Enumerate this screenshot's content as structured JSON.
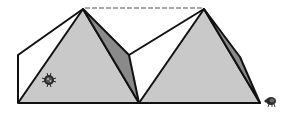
{
  "diagram": {
    "colors": {
      "background": "#ffffff",
      "outline": "#111111",
      "front_face": "#c9c9c9",
      "side_face": "#8a8a8a",
      "dashed_line": "#8c8c8c",
      "bug": "#2a2a2a"
    },
    "pyramids": [
      {
        "id": "left",
        "apex": [
          83,
          9
        ],
        "base_left": [
          18,
          103
        ],
        "base_right": [
          139,
          103
        ],
        "back_corner": [
          18,
          55
        ],
        "side_corner": [
          129,
          55
        ]
      },
      {
        "id": "right",
        "apex": [
          204,
          9
        ],
        "base_left": [
          139,
          103
        ],
        "base_right": [
          260,
          103
        ],
        "back_corner": [
          129,
          55
        ],
        "side_corner": [
          240,
          57
        ]
      }
    ],
    "dashed_line": {
      "from": [
        83,
        9
      ],
      "to": [
        204,
        9
      ]
    },
    "bugs": [
      {
        "id": "ladybug-on-pyramid",
        "center": [
          49,
          80
        ]
      },
      {
        "id": "bug-on-ground",
        "center": [
          271,
          101
        ]
      }
    ]
  }
}
